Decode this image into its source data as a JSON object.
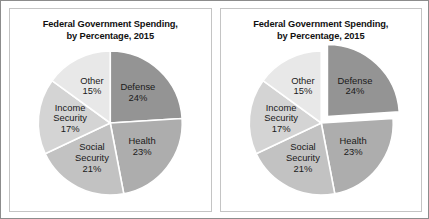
{
  "figure": {
    "panel_count": 2
  },
  "chart_data": [
    {
      "type": "pie",
      "id": "left",
      "title": "Federal Government Spending,",
      "subtitle": "by Percentage, 2015",
      "xlabel": "",
      "ylabel": "",
      "legend": "none",
      "labels_on_slices": true,
      "start_angle_deg": 0,
      "direction": "clockwise",
      "exploded_slice": null,
      "categories": [
        "Defense",
        "Health",
        "Social Security",
        "Income Security",
        "Other"
      ],
      "values": [
        24,
        23,
        21,
        17,
        15
      ],
      "value_labels": [
        "24%",
        "23%",
        "21%",
        "17%",
        "15%"
      ],
      "colors": [
        "#949494",
        "#adadad",
        "#c2c2c2",
        "#d4d4d4",
        "#e8e8e8"
      ],
      "slices": [
        {
          "name": "Defense",
          "percent": 24,
          "percent_label": "24%",
          "color": "#949494",
          "label_lines": [
            "Defense"
          ],
          "exploded": false
        },
        {
          "name": "Health",
          "percent": 23,
          "percent_label": "23%",
          "color": "#adadad",
          "label_lines": [
            "Health"
          ],
          "exploded": false
        },
        {
          "name": "Social Security",
          "percent": 21,
          "percent_label": "21%",
          "color": "#c2c2c2",
          "label_lines": [
            "Social",
            "Security"
          ],
          "exploded": false
        },
        {
          "name": "Income Security",
          "percent": 17,
          "percent_label": "17%",
          "color": "#d4d4d4",
          "label_lines": [
            "Income",
            "Security"
          ],
          "exploded": false
        },
        {
          "name": "Other",
          "percent": 15,
          "percent_label": "15%",
          "color": "#e8e8e8",
          "label_lines": [
            "Other"
          ],
          "exploded": false
        }
      ]
    },
    {
      "type": "pie",
      "id": "right",
      "title": "Federal Government Spending,",
      "subtitle": "by Percentage, 2015",
      "xlabel": "",
      "ylabel": "",
      "legend": "none",
      "labels_on_slices": true,
      "start_angle_deg": 0,
      "direction": "clockwise",
      "exploded_slice": "Defense",
      "categories": [
        "Defense",
        "Health",
        "Social Security",
        "Income Security",
        "Other"
      ],
      "values": [
        24,
        23,
        21,
        17,
        15
      ],
      "value_labels": [
        "24%",
        "23%",
        "21%",
        "17%",
        "15%"
      ],
      "colors": [
        "#949494",
        "#adadad",
        "#c2c2c2",
        "#d4d4d4",
        "#e8e8e8"
      ],
      "slices": [
        {
          "name": "Defense",
          "percent": 24,
          "percent_label": "24%",
          "color": "#949494",
          "label_lines": [
            "Defense"
          ],
          "exploded": true
        },
        {
          "name": "Health",
          "percent": 23,
          "percent_label": "23%",
          "color": "#adadad",
          "label_lines": [
            "Health"
          ],
          "exploded": false
        },
        {
          "name": "Social Security",
          "percent": 21,
          "percent_label": "21%",
          "color": "#c2c2c2",
          "label_lines": [
            "Social",
            "Security"
          ],
          "exploded": false
        },
        {
          "name": "Income Security",
          "percent": 17,
          "percent_label": "17%",
          "color": "#d4d4d4",
          "label_lines": [
            "Income",
            "Security"
          ],
          "exploded": false
        },
        {
          "name": "Other",
          "percent": 15,
          "percent_label": "15%",
          "color": "#e8e8e8",
          "label_lines": [
            "Other"
          ],
          "exploded": false
        }
      ]
    }
  ]
}
